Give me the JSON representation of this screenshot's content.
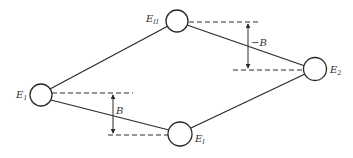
{
  "diagram": {
    "nodes": [
      {
        "id": "E1",
        "label": "E",
        "subscript": "1"
      },
      {
        "id": "EII",
        "label": "E",
        "subscript": "II"
      },
      {
        "id": "EI",
        "label": "E",
        "subscript": "I"
      },
      {
        "id": "E2",
        "label": "E",
        "subscript": "2"
      }
    ],
    "edges": [
      {
        "from": "E1",
        "to": "EII"
      },
      {
        "from": "EII",
        "to": "E2"
      },
      {
        "from": "E1",
        "to": "EI"
      },
      {
        "from": "EI",
        "to": "E2"
      }
    ],
    "annotations": [
      {
        "id": "shift-upper",
        "label": "−B",
        "between": [
          "EII",
          "E2"
        ]
      },
      {
        "id": "shift-lower",
        "label": "B",
        "between": [
          "E1",
          "EI"
        ]
      }
    ]
  }
}
